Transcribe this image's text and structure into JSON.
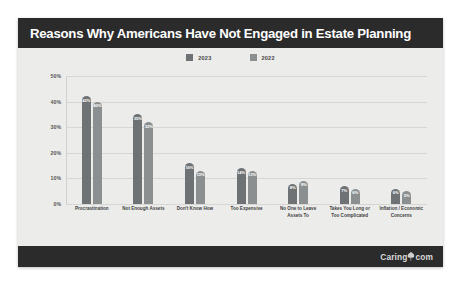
{
  "card": {
    "title": "Reasons Why Americans Have Not Engaged in Estate Planning",
    "watermark": "Caring",
    "watermark_suffix": "com",
    "watermark_icon": "caring-leaf-icon"
  },
  "colors": {
    "title_bar": "#2b2b2b",
    "series_2023": "#6e7274",
    "series_2022": "#8b8f90",
    "plot_bg": "#ececeb",
    "grid": "#d6d6d4"
  },
  "chart_data": {
    "type": "bar",
    "title": "Reasons Why Americans Have Not Engaged in Estate Planning",
    "xlabel": "",
    "ylabel": "",
    "ylim": [
      0,
      50
    ],
    "yticks": [
      "0%",
      "10%",
      "20%",
      "30%",
      "40%",
      "50%"
    ],
    "ytick_values": [
      0,
      10,
      20,
      30,
      40,
      50
    ],
    "grid": true,
    "legend_position": "top-center",
    "categories": [
      "Procrastination",
      "Not Enough Assets",
      "Don't Know How",
      "Too Expensive",
      "No One to Leave Assets To",
      "Takes You Long or Too Complicated",
      "Inflation / Economic Concerns"
    ],
    "series": [
      {
        "name": "2023",
        "color": "#6e7274",
        "values": [
          42,
          35,
          16,
          14,
          8,
          7,
          6
        ],
        "labels": [
          "42%",
          "35%",
          "16%",
          "14%",
          "8%",
          "7%",
          "6%"
        ]
      },
      {
        "name": "2022",
        "color": "#8b8f90",
        "values": [
          40,
          32,
          13,
          13,
          9,
          6,
          5
        ],
        "labels": [
          "40%",
          "32%",
          "13%",
          "13%",
          "9%",
          "6%",
          "5%"
        ]
      }
    ]
  }
}
